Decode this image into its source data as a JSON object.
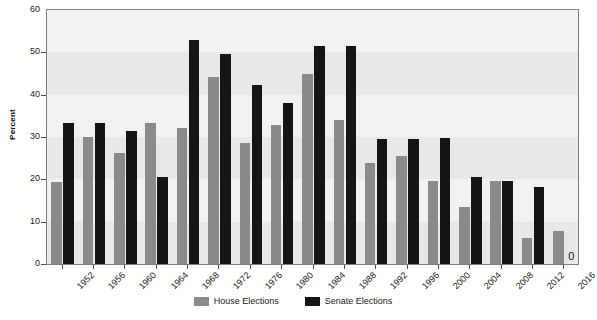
{
  "chart_data": {
    "type": "bar",
    "title": "",
    "subtitle": "",
    "xlabel": "",
    "ylabel": "Percent",
    "ylim": [
      0,
      60
    ],
    "yticks": [
      0,
      10,
      20,
      30,
      40,
      50,
      60
    ],
    "grid": false,
    "legend_position": "bottom-center",
    "categories": [
      "1952",
      "1956",
      "1960",
      "1964",
      "1968",
      "1972",
      "1976",
      "1980",
      "1984",
      "1988",
      "1992",
      "1996",
      "2000",
      "2004",
      "2008",
      "2012",
      "2016"
    ],
    "series": [
      {
        "name": "House Elections",
        "color": "#8a8a8a",
        "values": [
          19.4,
          29.9,
          26.3,
          33.3,
          32.1,
          44.1,
          28.6,
          32.8,
          44.8,
          34.0,
          23.9,
          25.6,
          19.7,
          13.4,
          19.5,
          6.1,
          7.8
        ]
      },
      {
        "name": "Senate Elections",
        "color": "#151515",
        "values": [
          33.2,
          33.2,
          31.4,
          20.6,
          52.8,
          49.6,
          42.3,
          38.0,
          51.6,
          51.6,
          29.5,
          29.5,
          29.7,
          20.6,
          19.6,
          18.1,
          0
        ]
      }
    ],
    "annotations": [
      {
        "text": "0",
        "series": "Senate Elections",
        "category": "2016",
        "value": 0
      }
    ]
  },
  "axes": {
    "y_title": "Percent",
    "y_tick_labels": [
      "60",
      "50",
      "40",
      "30",
      "20",
      "10",
      "0"
    ],
    "x_tick_labels": [
      "1952",
      "1956",
      "1960",
      "1964",
      "1968",
      "1972",
      "1976",
      "1980",
      "1984",
      "1988",
      "1992",
      "1996",
      "2000",
      "2004",
      "2008",
      "2012",
      "2016"
    ]
  },
  "legend": {
    "items": [
      {
        "label": "House Elections",
        "color": "#8a8a8a"
      },
      {
        "label": "Senate Elections",
        "color": "#151515"
      }
    ]
  },
  "style": {
    "plot_background": "#f2f2f2",
    "band_color": "#e8e8e8",
    "axis_color": "#7d7d7d",
    "text_color": "#1a1a1a"
  }
}
